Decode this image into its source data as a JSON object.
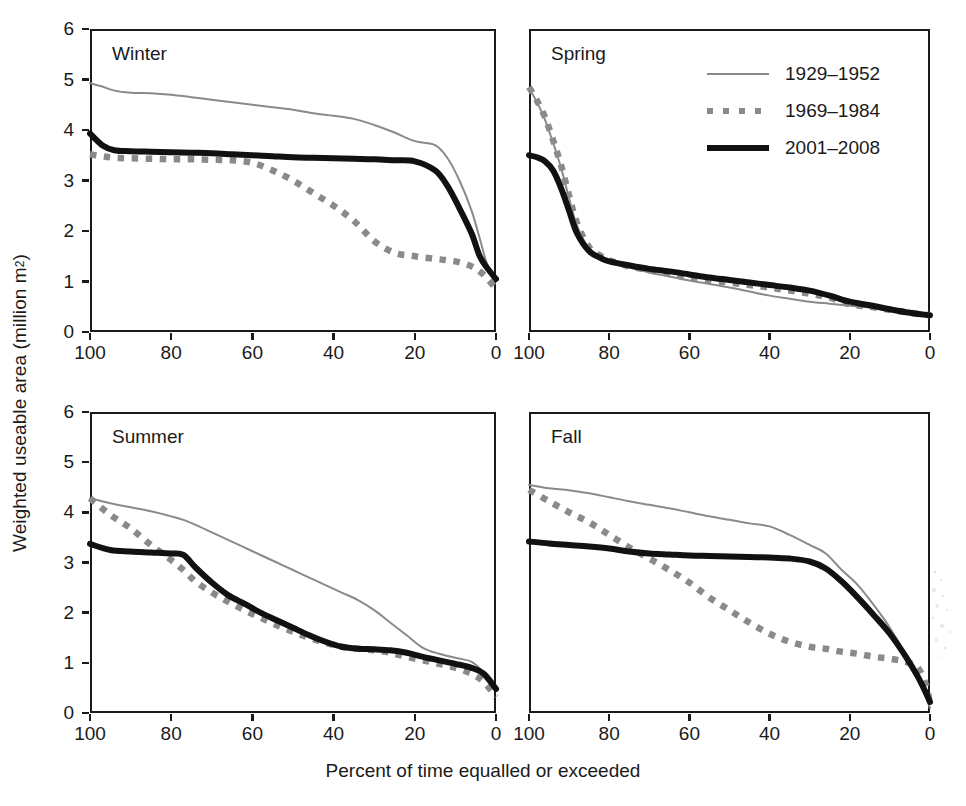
{
  "figure": {
    "xlabel": "Percent of time equalled or exceeded",
    "ylabel_text": "Weighted useable area (million m",
    "ylabel_sup": "2",
    "ylabel_tail": ")"
  },
  "legend": {
    "position": "top-right of Spring panel",
    "items": [
      {
        "label": "1929–1952",
        "style": "thin-gray-line",
        "color": "#8a8a8a"
      },
      {
        "label": "1969–1984",
        "style": "gray-dotted-line",
        "color": "#8a8a8a"
      },
      {
        "label": "2001–2008",
        "style": "thick-black-line",
        "color": "#111111"
      }
    ]
  },
  "axes": {
    "yticks": [
      "0",
      "1",
      "2",
      "3",
      "4",
      "5",
      "6"
    ],
    "xticks": [
      "100",
      "80",
      "60",
      "40",
      "20",
      "0"
    ],
    "ylim": [
      0,
      6
    ],
    "xlim": [
      100,
      0
    ],
    "grid": false
  },
  "chart_data": {
    "type": "line",
    "title": "",
    "xlabel": "Percent of time equalled or exceeded",
    "ylabel": "Weighted useable area (million m2)",
    "xlim": [
      100,
      0
    ],
    "ylim": [
      0,
      6
    ],
    "grid": false,
    "legend_position": "upper-right (Spring panel)",
    "x_descending": true,
    "panels": [
      {
        "name": "Winter",
        "x": [
          100,
          97,
          94,
          90,
          85,
          80,
          75,
          70,
          65,
          60,
          55,
          50,
          45,
          40,
          35,
          30,
          25,
          20,
          15,
          12,
          9,
          6,
          4,
          2,
          0
        ],
        "series": [
          {
            "name": "1929–1952",
            "style": "thin-gray-line",
            "values": [
              4.93,
              4.86,
              4.78,
              4.74,
              4.73,
              4.7,
              4.65,
              4.6,
              4.55,
              4.5,
              4.45,
              4.4,
              4.33,
              4.28,
              4.22,
              4.1,
              3.95,
              3.78,
              3.7,
              3.45,
              3.0,
              2.4,
              1.85,
              1.3,
              1.05
            ]
          },
          {
            "name": "1969–1984",
            "style": "gray-dotted-line",
            "values": [
              3.52,
              3.48,
              3.45,
              3.44,
              3.43,
              3.42,
              3.42,
              3.41,
              3.4,
              3.35,
              3.2,
              3.0,
              2.75,
              2.5,
              2.2,
              1.8,
              1.57,
              1.5,
              1.45,
              1.42,
              1.38,
              1.3,
              1.2,
              1.05,
              0.85
            ]
          },
          {
            "name": "2001–2008",
            "style": "thick-black-line",
            "values": [
              3.93,
              3.7,
              3.6,
              3.58,
              3.57,
              3.56,
              3.55,
              3.54,
              3.52,
              3.5,
              3.48,
              3.46,
              3.45,
              3.44,
              3.43,
              3.42,
              3.4,
              3.38,
              3.2,
              2.9,
              2.45,
              1.95,
              1.5,
              1.25,
              1.05
            ]
          }
        ]
      },
      {
        "name": "Spring",
        "x": [
          100,
          98,
          96,
          94,
          92,
          90,
          88,
          85,
          82,
          80,
          75,
          70,
          65,
          60,
          55,
          50,
          45,
          40,
          35,
          30,
          25,
          20,
          15,
          10,
          5,
          0
        ],
        "series": [
          {
            "name": "1929–1952",
            "style": "thin-gray-line",
            "values": [
              4.82,
              4.55,
              4.2,
              3.75,
              3.25,
              2.65,
              2.1,
              1.65,
              1.48,
              1.4,
              1.28,
              1.18,
              1.1,
              1.02,
              0.95,
              0.88,
              0.8,
              0.72,
              0.66,
              0.6,
              0.56,
              0.52,
              0.48,
              0.42,
              0.36,
              0.32
            ]
          },
          {
            "name": "1969–1984",
            "style": "gray-dotted-line",
            "values": [
              4.85,
              4.58,
              4.25,
              3.8,
              3.3,
              2.7,
              2.15,
              1.68,
              1.5,
              1.42,
              1.3,
              1.22,
              1.15,
              1.08,
              1.02,
              0.98,
              0.93,
              0.88,
              0.82,
              0.76,
              0.68,
              0.55,
              0.5,
              0.44,
              0.38,
              0.33
            ]
          },
          {
            "name": "2001–2008",
            "style": "thick-black-line",
            "values": [
              3.5,
              3.46,
              3.38,
              3.2,
              2.85,
              2.4,
              1.95,
              1.6,
              1.46,
              1.4,
              1.32,
              1.25,
              1.2,
              1.14,
              1.08,
              1.03,
              0.98,
              0.93,
              0.88,
              0.82,
              0.72,
              0.6,
              0.53,
              0.45,
              0.38,
              0.33
            ]
          }
        ]
      },
      {
        "name": "Summer",
        "x": [
          100,
          95,
          90,
          85,
          80,
          77,
          74,
          70,
          66,
          62,
          58,
          54,
          50,
          46,
          42,
          38,
          34,
          30,
          26,
          22,
          18,
          14,
          10,
          6,
          3,
          0
        ],
        "series": [
          {
            "name": "1929–1952",
            "style": "thin-gray-line",
            "values": [
              4.28,
              4.18,
              4.1,
              4.02,
              3.92,
              3.85,
              3.75,
              3.6,
              3.45,
              3.3,
              3.15,
              3.0,
              2.85,
              2.7,
              2.55,
              2.4,
              2.25,
              2.05,
              1.8,
              1.55,
              1.3,
              1.18,
              1.1,
              1.02,
              0.8,
              0.45
            ]
          },
          {
            "name": "1969–1984",
            "style": "gray-dotted-line",
            "values": [
              4.28,
              3.95,
              3.68,
              3.35,
              3.05,
              2.85,
              2.62,
              2.4,
              2.22,
              2.05,
              1.9,
              1.75,
              1.62,
              1.5,
              1.4,
              1.32,
              1.28,
              1.25,
              1.2,
              1.12,
              1.05,
              0.98,
              0.9,
              0.78,
              0.62,
              0.32
            ]
          },
          {
            "name": "2001–2008",
            "style": "thick-black-line",
            "values": [
              3.37,
              3.25,
              3.22,
              3.2,
              3.18,
              3.15,
              2.9,
              2.6,
              2.35,
              2.18,
              2.0,
              1.85,
              1.7,
              1.55,
              1.42,
              1.32,
              1.28,
              1.27,
              1.25,
              1.2,
              1.12,
              1.05,
              0.98,
              0.9,
              0.78,
              0.48
            ]
          }
        ]
      },
      {
        "name": "Fall",
        "x": [
          100,
          95,
          90,
          85,
          80,
          75,
          70,
          65,
          60,
          55,
          50,
          45,
          40,
          35,
          30,
          26,
          22,
          18,
          14,
          10,
          6,
          3,
          1,
          0
        ],
        "series": [
          {
            "name": "1929–1952",
            "style": "thin-gray-line",
            "values": [
              4.55,
              4.48,
              4.44,
              4.38,
              4.3,
              4.22,
              4.15,
              4.08,
              4.0,
              3.92,
              3.85,
              3.78,
              3.72,
              3.55,
              3.35,
              3.18,
              2.85,
              2.55,
              2.15,
              1.7,
              1.15,
              0.65,
              0.3,
              0.1
            ]
          },
          {
            "name": "1969–1984",
            "style": "gray-dotted-line",
            "values": [
              4.45,
              4.22,
              4.0,
              3.8,
              3.55,
              3.3,
              3.08,
              2.85,
              2.6,
              2.3,
              2.05,
              1.8,
              1.58,
              1.42,
              1.32,
              1.28,
              1.22,
              1.18,
              1.12,
              1.08,
              1.02,
              0.9,
              0.55,
              0.2
            ]
          },
          {
            "name": "2001–2008",
            "style": "thick-black-line",
            "values": [
              3.42,
              3.38,
              3.35,
              3.32,
              3.28,
              3.22,
              3.18,
              3.16,
              3.14,
              3.13,
              3.12,
              3.11,
              3.1,
              3.08,
              3.02,
              2.88,
              2.62,
              2.3,
              1.95,
              1.58,
              1.12,
              0.72,
              0.4,
              0.22
            ]
          }
        ]
      }
    ]
  }
}
